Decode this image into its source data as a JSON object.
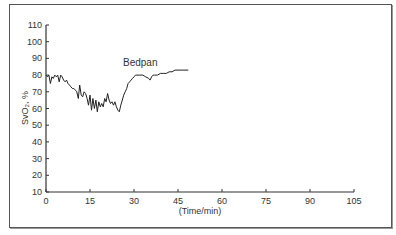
{
  "chart_data": {
    "type": "line",
    "title": "",
    "annotation": "Bedpan",
    "xlabel": "(Time/min)",
    "ylabel": "SvO₂, %",
    "xlim": [
      0,
      105
    ],
    "ylim": [
      10,
      110
    ],
    "x_ticks": [
      0,
      15,
      30,
      45,
      60,
      75,
      90,
      105
    ],
    "y_ticks": [
      10,
      20,
      30,
      40,
      50,
      60,
      70,
      80,
      90,
      100,
      110
    ],
    "grid": false,
    "legend": null,
    "series": [
      {
        "name": "SvO2",
        "x": [
          0,
          0.5,
          1,
          1.5,
          2,
          2.5,
          3,
          3.5,
          4,
          4.5,
          5,
          5.5,
          6,
          6.5,
          7,
          7.5,
          8,
          8.5,
          9,
          9.5,
          10,
          10.5,
          11,
          11.5,
          12,
          12.5,
          13,
          13.5,
          14,
          14.5,
          15,
          15.5,
          16,
          16.5,
          17,
          17.5,
          18,
          18.5,
          19,
          19.5,
          20,
          20.5,
          21,
          21.5,
          22,
          22.5,
          23,
          23.5,
          24,
          24.5,
          25,
          25.5,
          26,
          26.5,
          27,
          27.5,
          28,
          28.5,
          29,
          29.5,
          30,
          30.5,
          31,
          32,
          33,
          34,
          35,
          35.5,
          36,
          36.5,
          37,
          38,
          39,
          40,
          41,
          42,
          43,
          44,
          45,
          46,
          47,
          48.5
        ],
        "values": [
          80,
          79,
          80,
          75,
          79,
          78,
          80,
          79,
          80,
          76,
          80,
          79,
          77,
          76,
          77,
          75,
          74,
          73,
          72,
          72,
          71,
          70,
          66,
          74,
          68,
          67,
          70,
          69,
          66,
          62,
          68,
          59,
          66,
          60,
          65,
          58,
          64,
          61,
          63,
          61,
          66,
          64,
          69,
          65,
          63,
          64,
          62,
          64,
          61,
          59,
          58,
          62,
          65,
          68,
          70,
          72,
          75,
          76,
          77,
          78,
          79,
          80,
          80,
          80,
          80,
          79,
          78,
          77,
          79,
          80,
          80,
          80,
          81,
          81,
          81,
          82,
          82,
          83,
          83,
          83,
          83,
          83
        ]
      }
    ]
  }
}
